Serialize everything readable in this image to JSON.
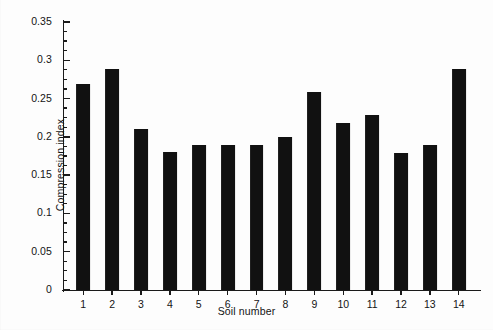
{
  "chart_data": {
    "type": "bar",
    "title": "",
    "xlabel": "Soil number",
    "ylabel": "Compression index",
    "categories": [
      "1",
      "2",
      "3",
      "4",
      "5",
      "6",
      "7",
      "8",
      "9",
      "10",
      "11",
      "12",
      "13",
      "14"
    ],
    "values": [
      0.269,
      0.289,
      0.21,
      0.18,
      0.19,
      0.19,
      0.19,
      0.2,
      0.258,
      0.218,
      0.228,
      0.179,
      0.189,
      0.288
    ],
    "ylim": [
      0,
      0.35
    ],
    "xlim": [
      0.3,
      14.7
    ],
    "ytick_labels": [
      "0",
      "0.05",
      "0.1",
      "0.15",
      "0.2",
      "0.25",
      "0.3",
      "0.35"
    ],
    "ytick_values": [
      0,
      0.05,
      0.1,
      0.15,
      0.2,
      0.25,
      0.3,
      0.35
    ],
    "yminor_step": 0.0125,
    "grid": false,
    "legend": null,
    "bar_color": "#111111",
    "axis_color": "#1a1a1a",
    "background_color": "#fdfdfd",
    "bar_width_fraction": 0.48
  }
}
